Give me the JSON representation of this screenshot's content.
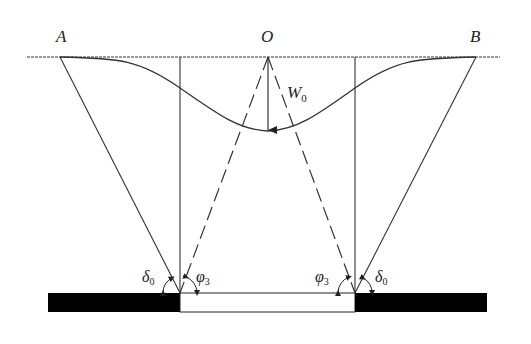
{
  "diagram": {
    "type": "mining subsidence geometry",
    "labels": {
      "point_a": "A",
      "point_o": "O",
      "point_b": "B",
      "max_subsidence": "W",
      "max_subsidence_sub": "0",
      "angle_delta_left": "δ",
      "angle_delta_left_sub": "0",
      "angle_phi_left": "φ",
      "angle_phi_left_sub": "3",
      "angle_phi_right": "φ",
      "angle_phi_right_sub": "3",
      "angle_delta_right": "δ",
      "angle_delta_right_sub": "0"
    },
    "colors": {
      "line": "#333333",
      "seam_solid": "#000000",
      "goaf": "#ffffff"
    }
  }
}
